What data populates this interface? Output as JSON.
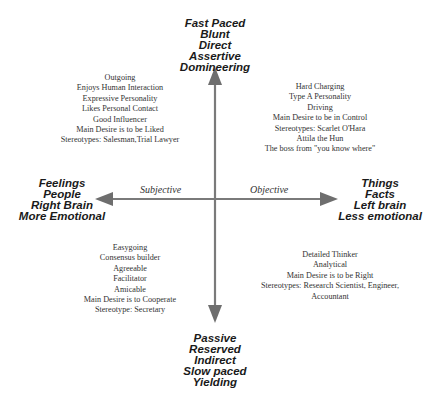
{
  "poles": {
    "top": [
      "Fast Paced",
      "Blunt",
      "Direct",
      "Assertive",
      "Domineering"
    ],
    "bottom": [
      "Passive",
      "Reserved",
      "Indirect",
      "Slow paced",
      "Yielding"
    ],
    "left": [
      "Feelings",
      "People",
      "Right Brain",
      "More Emotional"
    ],
    "right": [
      "Things",
      "Facts",
      "Left brain",
      "Less emotional"
    ]
  },
  "axis_labels": {
    "left": "Subjective",
    "right": "Objective"
  },
  "quadrants": {
    "top_left": [
      "Outgoing",
      "Enjoys Human Interaction",
      "Expressive Personality",
      "Likes Personal Contact",
      "Good Influencer",
      "Main Desire is to be Liked",
      "Stereotypes: Salesman,Trial Lawyer"
    ],
    "top_right": [
      "Hard Charging",
      "Type A Personality",
      "Driving",
      "Main Desire to be in Control",
      "Stereotypes: Scarlet O'Hara",
      "Attila the Hun",
      "The boss from \"you know where\""
    ],
    "bottom_left": [
      "Easygoing",
      "Consensus builder",
      "Agreeable",
      "Facilitator",
      "Amicable",
      "Main Desire is to Cooperate",
      "Stereotype: Secretary"
    ],
    "bottom_right": [
      "Detailed Thinker",
      "Analytical",
      "Main Desire is to be Right",
      "Stereotypes: Research Scientist, Engineer,",
      "Accountant"
    ]
  },
  "colors": {
    "axis": "#777777",
    "text": "#1a1a1a"
  }
}
